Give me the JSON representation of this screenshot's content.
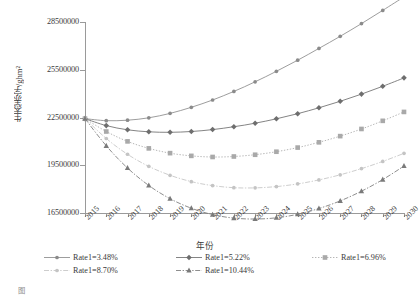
{
  "chart_data": {
    "type": "line",
    "title": "",
    "xlabel": "年份",
    "ylabel": "生态赤字/ghm²",
    "x": [
      2015,
      2016,
      2017,
      2018,
      2019,
      2020,
      2021,
      2022,
      2023,
      2024,
      2025,
      2026,
      2027,
      2028,
      2029,
      2030
    ],
    "xtick_labels": [
      "2015",
      "2016",
      "2017",
      "2018",
      "2019",
      "2020",
      "2021",
      "2022",
      "2023",
      "2024",
      "2025",
      "2026",
      "2027",
      "2028",
      "2029",
      "2030"
    ],
    "ylim": [
      16500000,
      28500000
    ],
    "ytick_values": [
      16500000,
      19500000,
      22500000,
      25500000,
      28500000
    ],
    "ytick_labels": [
      "16500000",
      "19500000",
      "22500000",
      "25500000",
      "28500000"
    ],
    "grid": false,
    "legend_position": "below-axes",
    "series": [
      {
        "name": "Rate1=3.48%",
        "marker": "circle",
        "linestyle": "solid",
        "color": "#8b8b8b",
        "values": [
          22430000,
          22300000,
          22330000,
          22480000,
          22760000,
          23140000,
          23600000,
          24140000,
          24740000,
          25400000,
          26100000,
          26840000,
          27600000,
          28400000,
          29230000,
          30080000
        ]
      },
      {
        "name": "Rate1=5.22%",
        "marker": "diamond",
        "linestyle": "solid",
        "color": "#6e6e6e",
        "values": [
          22430000,
          21990000,
          21730000,
          21600000,
          21570000,
          21620000,
          21740000,
          21920000,
          22140000,
          22420000,
          22740000,
          23110000,
          23520000,
          23970000,
          24460000,
          24990000
        ]
      },
      {
        "name": "Rate1=6.96%",
        "marker": "square",
        "linestyle": "dotted",
        "color": "#a9a9a9",
        "values": [
          22430000,
          21620000,
          21000000,
          20560000,
          20260000,
          20090000,
          20020000,
          20050000,
          20160000,
          20350000,
          20610000,
          20940000,
          21330000,
          21780000,
          22290000,
          22850000
        ]
      },
      {
        "name": "Rate1=8.70%",
        "marker": "circle",
        "linestyle": "dashdot",
        "color": "#c4c4c4",
        "values": [
          22430000,
          21180000,
          20190000,
          19430000,
          18870000,
          18470000,
          18220000,
          18090000,
          18080000,
          18160000,
          18330000,
          18580000,
          18900000,
          19290000,
          19740000,
          20250000
        ]
      },
      {
        "name": "Rate1=10.44%",
        "marker": "triangle",
        "linestyle": "dashdot",
        "color": "#7a7a7a",
        "values": [
          22430000,
          20720000,
          19330000,
          18230000,
          17400000,
          16800000,
          16400000,
          16180000,
          16120000,
          16200000,
          16420000,
          16780000,
          17260000,
          17870000,
          18600000,
          19450000
        ]
      }
    ]
  },
  "legend": {
    "entries": [
      {
        "label": "Rate1=3.48%"
      },
      {
        "label": "Rate1=5.22%"
      },
      {
        "label": "Rate1=6.96%"
      },
      {
        "label": "Rate1=8.70%"
      },
      {
        "label": "Rate1=10.44%"
      }
    ]
  },
  "caption": {
    "label": "图",
    "text": ""
  }
}
